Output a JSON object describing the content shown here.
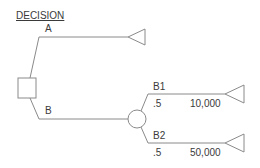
{
  "diagram": {
    "title": "DECISION",
    "branch_a": {
      "label": "A"
    },
    "branch_b": {
      "label": "B"
    },
    "outcome_b1": {
      "label": "B1",
      "probability": ".5",
      "payoff": "10,000"
    },
    "outcome_b2": {
      "label": "B2",
      "probability": ".5",
      "payoff": "50,000"
    },
    "colors": {
      "line": "#8a8a8a",
      "text": "#3a3a3a"
    },
    "nodes": [
      "decision-square",
      "chance-circle",
      "end-triangle-a",
      "end-triangle-b1",
      "end-triangle-b2"
    ]
  }
}
